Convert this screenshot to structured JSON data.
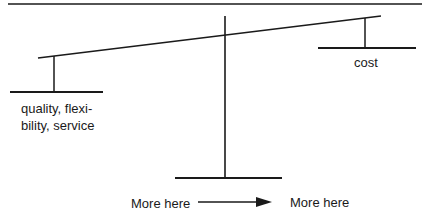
{
  "diagram": {
    "type": "balance-scale",
    "left_pan_label_lines": [
      "quality, flexi-",
      "bility, service"
    ],
    "right_pan_label": "cost",
    "bottom": {
      "left_label": "More here",
      "right_label": "More here",
      "arrow_direction": "right"
    },
    "colors": {
      "line": "#1a1a1a",
      "background": "#ffffff"
    }
  }
}
